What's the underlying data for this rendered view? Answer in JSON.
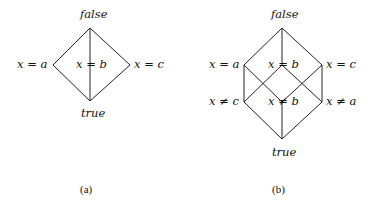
{
  "figure_a": {
    "caption": "(a)",
    "nodes": {
      "top": "false",
      "left": "x = a",
      "middle": "x = b",
      "right": "x = c",
      "bottom": "true"
    }
  },
  "figure_b": {
    "caption": "(b)",
    "nodes": {
      "top": "false",
      "upper_left": "x = a",
      "upper_middle": "x = b",
      "upper_right": "x = c",
      "lower_left": "x ≠ c",
      "lower_middle": "x ≠ b",
      "lower_right": "x ≠ a",
      "bottom": "true"
    }
  },
  "colors": {
    "line": "#222222",
    "text": "#111111",
    "background": "#ffffff"
  }
}
